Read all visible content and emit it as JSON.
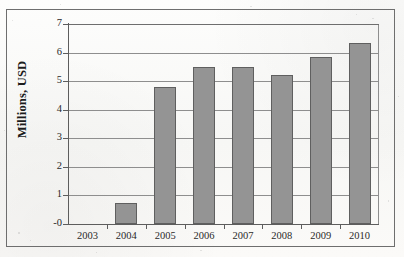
{
  "chart_data": {
    "type": "bar",
    "title": "",
    "xlabel": "",
    "ylabel": "Millions, USD",
    "categories": [
      "2003",
      "2004",
      "2005",
      "2006",
      "2007",
      "2008",
      "2009",
      "2010"
    ],
    "values": [
      0,
      0.75,
      4.8,
      5.5,
      5.5,
      5.2,
      5.85,
      6.35
    ],
    "series": [
      {
        "name": "Millions, USD",
        "values": [
          0,
          0.75,
          4.8,
          5.5,
          5.5,
          5.2,
          5.85,
          6.35
        ]
      }
    ],
    "ylim": [
      0,
      7
    ],
    "yticks": [
      0,
      1,
      2,
      3,
      4,
      5,
      6,
      7
    ],
    "ytick_labels": [
      "-0",
      "1",
      "2",
      "3",
      "4",
      "5",
      "6",
      "7"
    ],
    "grid": true,
    "legend": "none",
    "bar_color": "#949494",
    "bar_border_color": "#5f5f5f",
    "gridline_color": "#8e8e8e",
    "axis_color": "#5d5d5d",
    "frame_color": "#6e6e6e",
    "background_color": "#fbfaf8"
  }
}
